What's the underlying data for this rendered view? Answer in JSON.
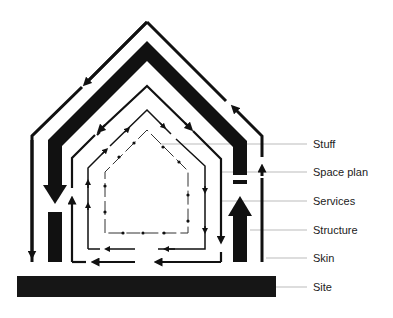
{
  "diagram": {
    "colors": {
      "ink": "#111111",
      "leader": "#bbbbbb",
      "label": "#222222",
      "background": "#ffffff"
    },
    "layers": [
      {
        "id": "stuff",
        "label": "Stuff",
        "order": 1
      },
      {
        "id": "space-plan",
        "label": "Space plan",
        "order": 2
      },
      {
        "id": "services",
        "label": "Services",
        "order": 3
      },
      {
        "id": "structure",
        "label": "Structure",
        "order": 4
      },
      {
        "id": "skin",
        "label": "Skin",
        "order": 5
      },
      {
        "id": "site",
        "label": "Site",
        "order": 6
      }
    ]
  }
}
